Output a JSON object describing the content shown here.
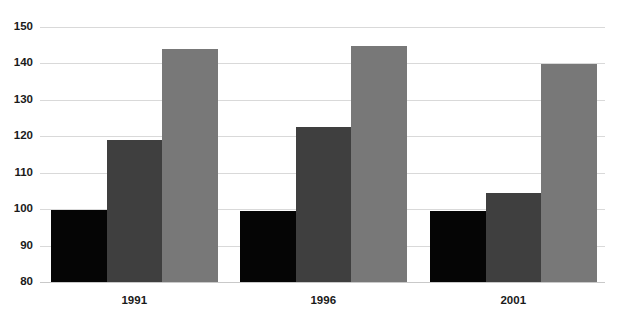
{
  "chart_data": {
    "type": "bar",
    "title": "",
    "subtitle": "",
    "xlabel": "",
    "ylabel": "",
    "categories": [
      "1991",
      "1996",
      "2001"
    ],
    "series": [
      {
        "name": "series-1",
        "color": "#050505",
        "values": [
          99.8,
          99.5,
          99.5
        ]
      },
      {
        "name": "series-2",
        "color": "#3f3f3f",
        "values": [
          119.0,
          122.5,
          104.5
        ]
      },
      {
        "name": "series-3",
        "color": "#787878",
        "values": [
          144.0,
          144.8,
          139.8
        ]
      }
    ],
    "ylim": [
      80,
      150
    ],
    "yticks": [
      80,
      90,
      100,
      110,
      120,
      130,
      140,
      150
    ],
    "ytick_labels": [
      "80",
      "90",
      "100",
      "110",
      "120",
      "130",
      "140",
      "150"
    ],
    "grid": true,
    "grid_axis": "y",
    "legend": false,
    "legend_position": "none",
    "annotations": []
  }
}
